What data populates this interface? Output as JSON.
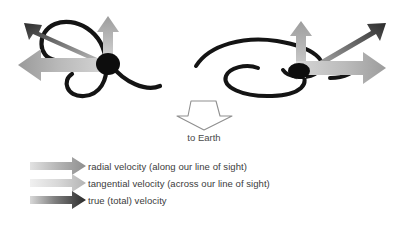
{
  "figure": {
    "background_color": "#ffffff"
  },
  "observer": {
    "label": "to Earth",
    "arrow_direction": "down",
    "arrow_style": "hollow-outline",
    "outline_color": "#8a8a8a"
  },
  "colors": {
    "radial": "#9e9e9e",
    "radial_light": "#d2d2d2",
    "radial_dark": "#8b8b8b",
    "tangential": "#c4c4c4",
    "tangential_light": "#ededed",
    "tangential_dark": "#b0b0b0",
    "true": "#4a4a4a",
    "true_light": "#c9c9c9",
    "true_dark": "#2e2e2e",
    "galaxy_arm": "#141414",
    "nucleus": "#0d0d0d",
    "text": "#3b3b3b"
  },
  "galaxies": [
    {
      "id": "left-galaxy",
      "name": "face-on-spiral-galaxy",
      "orientation": "face-on",
      "vectors": [
        {
          "name": "radial-velocity-arrow",
          "type": "radial",
          "direction": "left",
          "label": "radial velocity"
        },
        {
          "name": "tangential-velocity-arrow",
          "type": "tangential",
          "direction": "up",
          "label": "tangential velocity"
        },
        {
          "name": "true-velocity-arrow",
          "type": "true",
          "direction": "up-left",
          "label": "true (total) velocity"
        }
      ]
    },
    {
      "id": "right-galaxy",
      "name": "inclined-spiral-galaxy",
      "orientation": "inclined",
      "vectors": [
        {
          "name": "radial-velocity-arrow",
          "type": "radial",
          "direction": "right",
          "label": "radial velocity"
        },
        {
          "name": "tangential-velocity-arrow",
          "type": "tangential",
          "direction": "up",
          "label": "tangential velocity"
        },
        {
          "name": "true-velocity-arrow",
          "type": "true",
          "direction": "up-right",
          "label": "true (total) velocity"
        }
      ]
    }
  ],
  "legend": {
    "items": [
      {
        "key": "radial",
        "label": "radial velocity (along our line of sight)"
      },
      {
        "key": "tangential",
        "label": "tangential velocity (across our line of sight)"
      },
      {
        "key": "true",
        "label": "true (total) velocity"
      }
    ]
  }
}
